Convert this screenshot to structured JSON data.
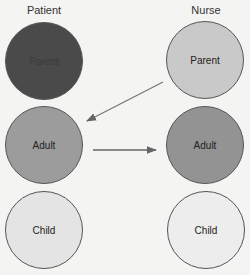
{
  "diagram": {
    "columns": [
      {
        "title": "Patient"
      },
      {
        "title": "Nurse"
      }
    ],
    "patient": {
      "parent": {
        "label": "Parent",
        "color": "#4a4a4a"
      },
      "adult": {
        "label": "Adult",
        "color": "#9c9c9c"
      },
      "child": {
        "label": "Child",
        "color": "#e4e4e4"
      }
    },
    "nurse": {
      "parent": {
        "label": "Parent",
        "color": "#c9c9c9"
      },
      "adult": {
        "label": "Adult",
        "color": "#939393"
      },
      "child": {
        "label": "Child",
        "color": "#ededed"
      }
    },
    "arrows": [
      {
        "from": "Nurse Parent",
        "to": "Patient Adult"
      },
      {
        "from": "Patient Adult",
        "to": "Nurse Adult"
      }
    ]
  }
}
